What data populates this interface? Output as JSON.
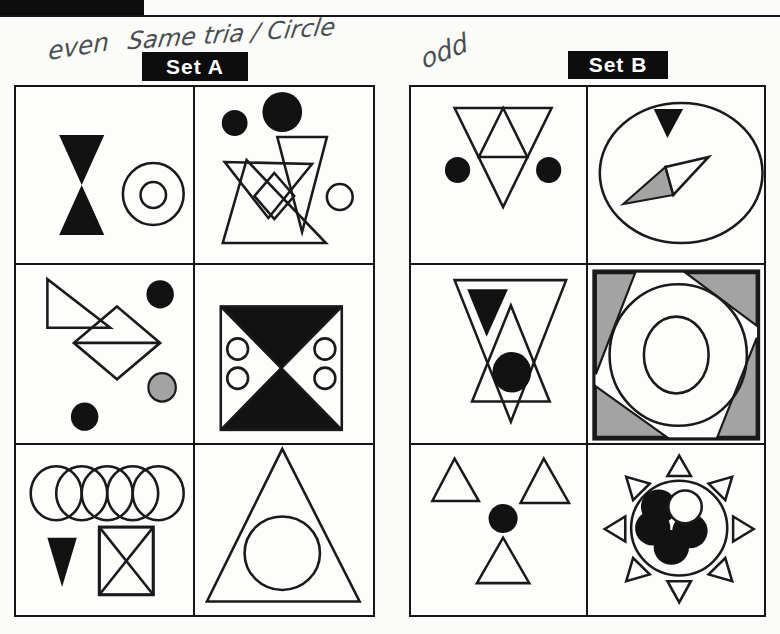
{
  "header": {
    "bar_note": "black header tab cropped at top edge, no text visible"
  },
  "annotations": {
    "left": "even",
    "middle": "Same tria / Circle",
    "right": "odd",
    "ink_color": "#4a4e53"
  },
  "set_a": {
    "label": "Set A",
    "cells": [
      {
        "description": "black hourglass of two triangles; concentric double circle"
      },
      {
        "description": "small and large black circles; overlapping outline triangles with diamond; small outline circle"
      },
      {
        "description": "outline right triangle; diamond with horizontal diagonal; black circle top-right; gray circle; black circle bottom-left"
      },
      {
        "description": "square split by diagonals, top and bottom quarters black, two outline circles in each white side quarter"
      },
      {
        "description": "row of five overlapping circles; black down-pointing triangle; rectangle crossed by X"
      },
      {
        "description": "large outline triangle containing a circle"
      }
    ]
  },
  "set_b": {
    "label": "Set B",
    "cells": [
      {
        "description": "inverted triangle subdivided into four small triangles; black circle on each side"
      },
      {
        "description": "large circle containing black down triangle and a two-tone (gray/white) needle rhombus"
      },
      {
        "description": "large inverted outline triangle with solid black inverted triangle, overlapping upward triangle and black circle"
      },
      {
        "description": "square with four gray corner triangles around concentric circles"
      },
      {
        "description": "three outline triangles arranged around a central black circle"
      },
      {
        "description": "sun figure: ring holding four black circles and one white circle, eight outline triangle rays"
      }
    ]
  },
  "colors": {
    "paper": "#fbfbf9",
    "shape_black": "#121212",
    "shape_gray": "#a3a3a3",
    "label_bg": "#0d0d0d",
    "label_text": "#ffffff"
  }
}
